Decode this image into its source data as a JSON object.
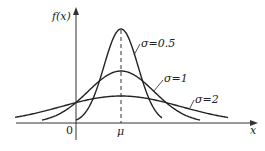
{
  "chart_data": {
    "type": "line",
    "title": "",
    "xlabel": "x",
    "ylabel": "f(x)",
    "x_ticks": [
      "0",
      "μ"
    ],
    "grid": false,
    "legend": "inline annotations",
    "series": [
      {
        "name": "σ=0.5",
        "sigma": 0.5,
        "peak_rel": 1.0
      },
      {
        "name": "σ=1",
        "sigma": 1,
        "peak_rel": 0.55
      },
      {
        "name": "σ=2",
        "sigma": 2,
        "peak_rel": 0.28
      }
    ],
    "annotations": [
      "dashed vertical line at x=μ"
    ]
  },
  "labels": {
    "ylabel": "f(x)",
    "xlabel": "x",
    "origin": "0",
    "mu": "μ",
    "s05": "σ=0.5",
    "s1": "σ=1",
    "s2": "σ=2"
  }
}
